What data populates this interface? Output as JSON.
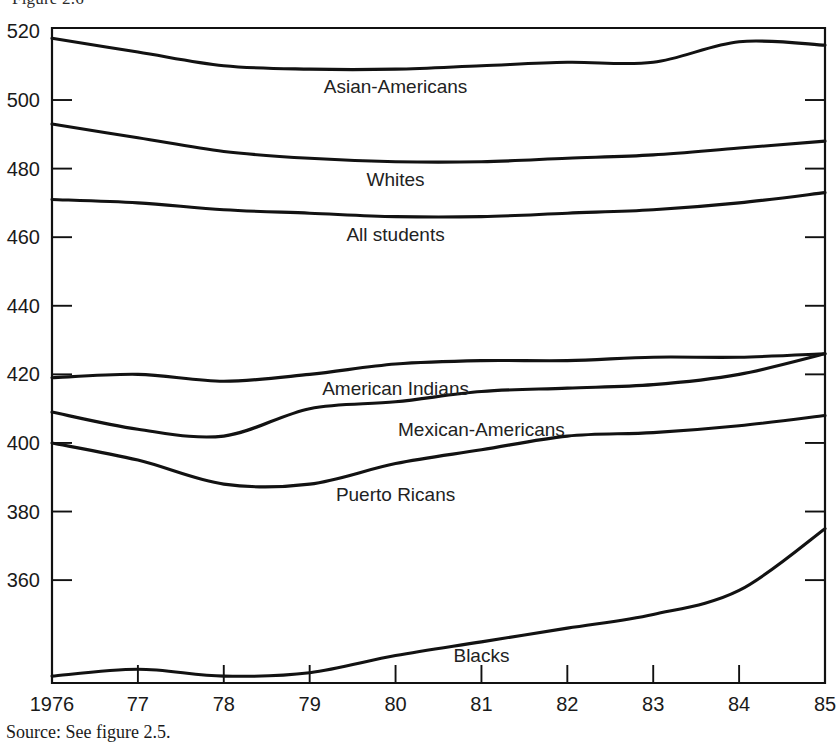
{
  "figure": {
    "caption_fragment": "Figure 2.6",
    "source_note": "Source: See figure 2.5."
  },
  "chart_data": {
    "type": "line",
    "title": "",
    "subtitle": "",
    "xlabel": "",
    "ylabel": "",
    "grid": false,
    "legend_position": "inline-labels",
    "x": [
      1976,
      1977,
      1978,
      1979,
      1980,
      1981,
      1982,
      1983,
      1984,
      1985
    ],
    "x_tick_labels": [
      "1976",
      "77",
      "78",
      "79",
      "80",
      "81",
      "82",
      "83",
      "84",
      "85"
    ],
    "y_tick_labels": [
      "520",
      "500",
      "480",
      "460",
      "440",
      "420",
      "400",
      "380",
      "360"
    ],
    "y_ticks": [
      520,
      500,
      480,
      460,
      440,
      420,
      400,
      380,
      360
    ],
    "xlim": [
      1976,
      1985
    ],
    "ylim": [
      330,
      521
    ],
    "series": [
      {
        "name": "Asian-Americans",
        "values": [
          518,
          514,
          510,
          509,
          509,
          510,
          511,
          511,
          517,
          516
        ],
        "label_x": 1980,
        "label_y": 502
      },
      {
        "name": "Whites",
        "values": [
          493,
          489,
          485,
          483,
          482,
          482,
          483,
          484,
          486,
          488
        ],
        "label_x": 1980,
        "label_y": 475
      },
      {
        "name": "All students",
        "values": [
          471,
          470,
          468,
          467,
          466,
          466,
          467,
          468,
          470,
          473
        ],
        "label_x": 1980,
        "label_y": 459
      },
      {
        "name": "American Indians",
        "values": [
          419,
          420,
          418,
          420,
          423,
          424,
          424,
          425,
          425,
          426
        ],
        "label_x": 1980,
        "label_y": 414
      },
      {
        "name": "Mexican-Americans",
        "values": [
          409,
          404,
          402,
          410,
          412,
          415,
          416,
          417,
          420,
          426
        ],
        "label_x": 1981,
        "label_y": 402
      },
      {
        "name": "Puerto Ricans",
        "values": [
          400,
          395,
          388,
          388,
          394,
          398,
          402,
          403,
          405,
          408
        ],
        "label_x": 1980,
        "label_y": 383
      },
      {
        "name": "Blacks",
        "values": [
          332,
          334,
          332,
          333,
          338,
          342,
          346,
          350,
          357,
          375
        ],
        "label_x": 1981,
        "label_y": 336
      }
    ]
  }
}
